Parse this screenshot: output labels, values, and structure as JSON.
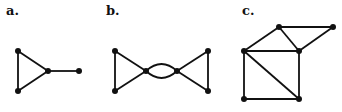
{
  "panels": [
    {
      "label": "a.",
      "label_pos": [
        6,
        3
      ],
      "nodes": [
        [
          18,
          51
        ],
        [
          18,
          91
        ],
        [
          48,
          71
        ],
        [
          79,
          71
        ]
      ],
      "edges": [
        [
          0,
          1
        ],
        [
          0,
          2
        ],
        [
          1,
          2
        ],
        [
          2,
          3
        ]
      ],
      "curved_edges": []
    },
    {
      "label": "b.",
      "label_pos": [
        106,
        3
      ],
      "nodes": [
        [
          115,
          51
        ],
        [
          115,
          91
        ],
        [
          146,
          71
        ],
        [
          177,
          71
        ],
        [
          208,
          51
        ],
        [
          208,
          91
        ]
      ],
      "edges": [
        [
          0,
          1
        ],
        [
          0,
          2
        ],
        [
          1,
          2
        ],
        [
          3,
          4
        ],
        [
          3,
          5
        ],
        [
          4,
          5
        ]
      ],
      "curved_edges": [
        [
          2,
          3,
          -7
        ],
        [
          2,
          3,
          7
        ]
      ]
    },
    {
      "label": "c.",
      "label_pos": [
        242,
        3
      ],
      "nodes": [
        [
          244,
          51
        ],
        [
          279,
          27
        ],
        [
          333,
          27
        ],
        [
          299,
          51
        ],
        [
          244,
          99
        ],
        [
          299,
          99
        ]
      ],
      "edges": [
        [
          0,
          1
        ],
        [
          1,
          2
        ],
        [
          1,
          3
        ],
        [
          2,
          3
        ],
        [
          0,
          3
        ],
        [
          0,
          4
        ],
        [
          0,
          5
        ],
        [
          3,
          5
        ],
        [
          4,
          5
        ]
      ],
      "curved_edges": []
    }
  ],
  "style": {
    "stroke": "#111111",
    "node_fill": "#111111",
    "node_radius": 3,
    "stroke_width": 1.8
  }
}
